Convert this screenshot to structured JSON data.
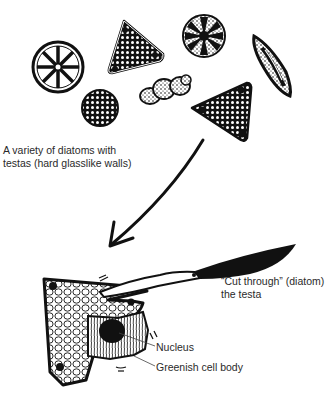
{
  "figure": {
    "caption_top": {
      "line1": "A variety of diatoms with",
      "line2": "testas (hard glasslike walls)"
    },
    "callout_cut": {
      "line1": "“Cut through” (diatom)",
      "line2": "the testa"
    },
    "label_nucleus": "Nucleus",
    "label_cell_body": "Greenish cell body",
    "diatoms": [
      {
        "shape": "wheel",
        "description": "circular diatom with 8 radial spokes"
      },
      {
        "shape": "triangle",
        "description": "triangular diatom with dotted interior and corner spots"
      },
      {
        "shape": "star-disc",
        "description": "circular diatom with dark star pattern"
      },
      {
        "shape": "spindle",
        "description": "elongated diamond diatom with central raphe"
      },
      {
        "shape": "disc",
        "description": "small dark dotted disc"
      },
      {
        "shape": "chain",
        "description": "lumpy chain-like colony"
      },
      {
        "shape": "triangle",
        "description": "larger triangular diatom with corner spots"
      }
    ],
    "colors": {
      "ink": "#111111",
      "background": "#ffffff",
      "text": "#2a2a2a"
    }
  }
}
